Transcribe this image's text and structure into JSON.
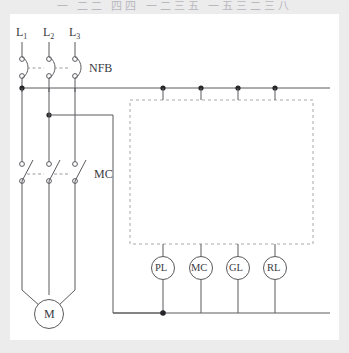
{
  "page": {
    "top_caption": "一 二二 四四 一二三五 一五三二三八",
    "background_color": "#ececed",
    "panel_color": "#ffffff",
    "line_color": "#5a5a5f",
    "dash_color": "#a8a8ad",
    "text_color": "#3b3b3f"
  },
  "diagram": {
    "supply_lines": [
      {
        "id": "L1",
        "label": "L",
        "subscript": "1"
      },
      {
        "id": "L2",
        "label": "L",
        "subscript": "2"
      },
      {
        "id": "L3",
        "label": "L",
        "subscript": "3"
      }
    ],
    "devices": {
      "breaker_label": "NFB",
      "contactor_label": "MC",
      "motor_label": "M"
    },
    "indicator_lamps": [
      {
        "id": "lamp-pl",
        "label": "PL"
      },
      {
        "id": "lamp-mc",
        "label": "MC"
      },
      {
        "id": "lamp-gl",
        "label": "GL"
      },
      {
        "id": "lamp-rl",
        "label": "RL"
      }
    ],
    "control_box": {
      "label": "control-circuit-dashed-enclosure",
      "style": "dashed"
    }
  }
}
